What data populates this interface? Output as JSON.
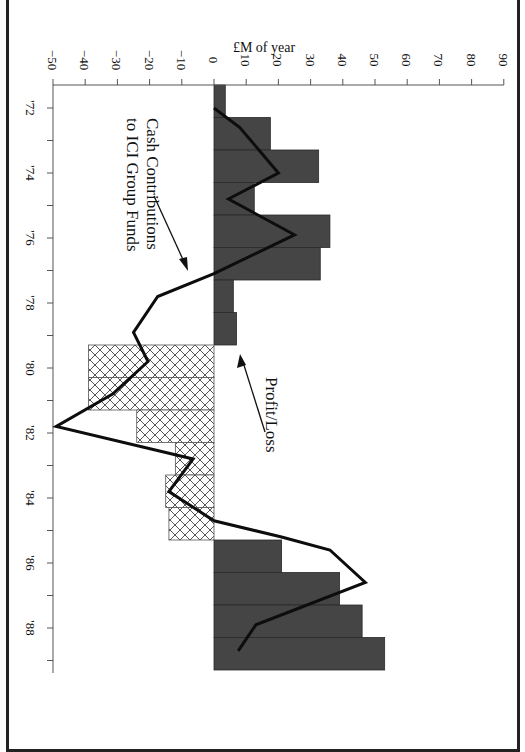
{
  "chart_data": {
    "type": "bar",
    "orientation": "rotated-90-clockwise",
    "title": "",
    "ylabel": "£M of year",
    "xlabel": "",
    "ylim": [
      -50,
      90
    ],
    "yticks": [
      -50,
      -40,
      -30,
      -20,
      -10,
      0,
      10,
      20,
      30,
      40,
      50,
      60,
      70,
      80,
      90
    ],
    "ytick_labels": [
      "−50",
      "−40",
      "−30",
      "−20",
      "−10",
      "0",
      "10",
      "20",
      "30",
      "40",
      "50",
      "60",
      "70",
      "80",
      "90"
    ],
    "categories": [
      "'72",
      "'73",
      "'74",
      "'75",
      "'76",
      "'77",
      "'78",
      "'79",
      "'80",
      "'81",
      "'82",
      "'83",
      "'84",
      "'85",
      "'86",
      "'87",
      "'88",
      "'89"
    ],
    "xtick_labels": [
      "'72",
      "'74",
      "'76",
      "'78",
      "'80",
      "'82",
      "'84",
      "'86",
      "'88"
    ],
    "grid": false,
    "series": [
      {
        "name": "Profit/Loss",
        "type": "bar",
        "profit_style": "solid dark grey",
        "loss_style": "cross-hatched",
        "values": [
          3.5,
          17.5,
          32.5,
          12.5,
          36,
          33,
          6,
          7,
          -39,
          -39,
          -24,
          -12,
          -15,
          -14,
          21,
          39,
          46,
          53
        ]
      },
      {
        "name": "Cash Contributions to ICI Group Funds",
        "type": "line",
        "points": [
          {
            "x": 1972.0,
            "y": 0
          },
          {
            "x": 1972.6,
            "y": 8
          },
          {
            "x": 1973.3,
            "y": 14
          },
          {
            "x": 1974.0,
            "y": 20
          },
          {
            "x": 1974.8,
            "y": 4.5
          },
          {
            "x": 1975.9,
            "y": 25
          },
          {
            "x": 1977.1,
            "y": 0
          },
          {
            "x": 1977.8,
            "y": -17.5
          },
          {
            "x": 1978.9,
            "y": -25
          },
          {
            "x": 1979.8,
            "y": -20.5
          },
          {
            "x": 1980.8,
            "y": -31.5
          },
          {
            "x": 1981.8,
            "y": -49
          },
          {
            "x": 1982.8,
            "y": -6.5
          },
          {
            "x": 1983.8,
            "y": -14
          },
          {
            "x": 1984.7,
            "y": 0
          },
          {
            "x": 1985.2,
            "y": 21
          },
          {
            "x": 1985.6,
            "y": 36
          },
          {
            "x": 1986.6,
            "y": 47
          },
          {
            "x": 1987.9,
            "y": 13
          },
          {
            "x": 1988.7,
            "y": 7.5
          }
        ]
      }
    ],
    "annotations": [
      {
        "text_lines": [
          "Cash Contributions",
          "to ICI Group Funds"
        ],
        "points_to": "line"
      },
      {
        "text_lines": [
          "Profit/Loss"
        ],
        "points_to": "bars"
      }
    ],
    "colors": {
      "profit_fill": "#454545",
      "loss_hatch": "#444444",
      "line": "#0d0d0d",
      "axis": "#555555"
    }
  }
}
